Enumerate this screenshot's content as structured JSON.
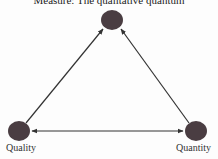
{
  "diagram": {
    "title": "Measure: The qualitative quantum",
    "nodes": [
      {
        "id": "measure",
        "label": "",
        "x": 112,
        "y": 20,
        "color": "#4a3d42"
      },
      {
        "id": "quality",
        "label": "Quality",
        "x": 19,
        "y": 131,
        "color": "#4a3d42"
      },
      {
        "id": "quantity",
        "label": "Quantity",
        "x": 196,
        "y": 131,
        "color": "#4a3d42"
      }
    ],
    "edges": [
      {
        "from": "quality",
        "to": "measure",
        "type": "arrow"
      },
      {
        "from": "quantity",
        "to": "measure",
        "type": "arrow"
      },
      {
        "from": "quality",
        "to": "quantity",
        "type": "double-arrow"
      }
    ],
    "labels": {
      "quality": "Quality",
      "quantity": "Quantity"
    }
  }
}
